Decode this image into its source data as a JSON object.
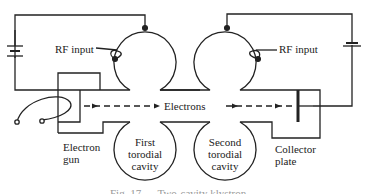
{
  "diagram": {
    "type": "klystron-schematic",
    "labels": {
      "rf_input_left": "RF input",
      "rf_input_right": "RF input",
      "electrons": "Electrons",
      "electron_gun_line1": "Electron",
      "electron_gun_line2": "gun",
      "first_cavity_line1": "First",
      "first_cavity_line2": "torodial",
      "first_cavity_line3": "cavity",
      "second_cavity_line1": "Second",
      "second_cavity_line2": "torodial",
      "second_cavity_line3": "cavity",
      "collector_line1": "Collector",
      "collector_line2": "plate",
      "caption": "Fig. 17.__  Two-cavity klystron"
    },
    "components": [
      "battery-left",
      "battery-right",
      "electron-gun",
      "first-torodial-cavity",
      "second-torodial-cavity",
      "collector-plate",
      "heater-filament"
    ],
    "colors": {
      "line": "#222222",
      "background": "#ffffff"
    }
  }
}
